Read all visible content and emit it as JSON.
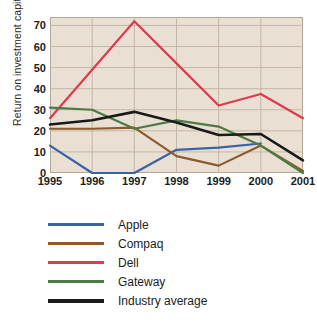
{
  "chart_data": {
    "type": "line",
    "title": "",
    "xlabel": "",
    "ylabel": "Return on investment capital",
    "categories": [
      "1995",
      "1996",
      "1997",
      "1998",
      "1999",
      "2000",
      "2001"
    ],
    "x": [
      1995,
      1996,
      1997,
      1998,
      1999,
      2000,
      2001
    ],
    "xlim": [
      1995,
      2001
    ],
    "ylim": [
      0,
      74
    ],
    "yticks": [
      0,
      10,
      20,
      30,
      40,
      50,
      60,
      70
    ],
    "grid": true,
    "legend_position": "bottom-left",
    "series": [
      {
        "name": "Apple",
        "color": "#3a62a8",
        "values": [
          13,
          0,
          0,
          11,
          12,
          14,
          null
        ]
      },
      {
        "name": "Compaq",
        "color": "#8d5a2b",
        "values": [
          21,
          21,
          21.5,
          8,
          3.5,
          13,
          1
        ]
      },
      {
        "name": "Dell",
        "color": "#e0394f",
        "values": [
          26,
          49,
          72,
          52,
          32,
          37.5,
          26
        ]
      },
      {
        "name": "Gateway",
        "color": "#4c7a45",
        "values": [
          31,
          30,
          21,
          25,
          22,
          13,
          0
        ]
      },
      {
        "name": "Industry average",
        "color": "#1a1a1a",
        "values": [
          23,
          25,
          29,
          24,
          18,
          18.5,
          6
        ]
      }
    ]
  },
  "legend": {
    "items": [
      {
        "label": "Apple",
        "color": "#3a62a8"
      },
      {
        "label": "Compaq",
        "color": "#8d5a2b"
      },
      {
        "label": "Dell",
        "color": "#e0394f"
      },
      {
        "label": "Gateway",
        "color": "#4c7a45"
      },
      {
        "label": "Industry average",
        "color": "#1a1a1a"
      }
    ]
  },
  "axes": {
    "y_title": "Return on investment capital",
    "y_tick_labels": [
      "70",
      "60",
      "50",
      "40",
      "30",
      "20",
      "10",
      "0"
    ],
    "x_tick_labels": [
      "1995",
      "1996",
      "1997",
      "1998",
      "1999",
      "2000",
      "2001"
    ]
  },
  "style": {
    "plot_background": "#e9dfd2",
    "grid_color": "#c3b7a6",
    "frame_color": "#b3a694",
    "page_background": "#ffffff"
  }
}
